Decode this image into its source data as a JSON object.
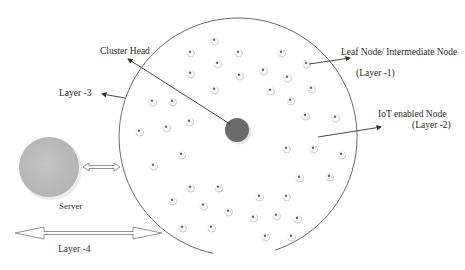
{
  "labels": {
    "cluster_head": "Cluster Head",
    "leaf_node": "Leaf Node/ Intermediate Node",
    "layer1": "(Layer -1)",
    "iot_node": "IoT enabled Node",
    "layer2": "(Layer -2)",
    "layer3": "Layer -3",
    "server": "Server",
    "layer4": "Layer -4"
  },
  "colors": {
    "outline": "#6a6a6a",
    "cluster_head": "#6b6b6b",
    "server": "#bdbdbd",
    "node_dot": "#6a6a6a",
    "node_shadow": "#d4d4d4",
    "arrow": "#333333",
    "text": "#2a2a2a"
  },
  "cluster": {
    "cx": 238,
    "cy": 137,
    "r": 119,
    "gap_start_deg": 72,
    "gap_end_deg": 102
  },
  "cluster_head": {
    "cx": 237,
    "cy": 130,
    "r": 12
  },
  "server": {
    "cx": 49,
    "cy": 167,
    "r": 31
  },
  "nodes": [
    [
      214,
      40
    ],
    [
      190,
      52
    ],
    [
      217,
      63
    ],
    [
      190,
      73
    ],
    [
      214,
      89
    ],
    [
      238,
      52
    ],
    [
      281,
      52
    ],
    [
      306,
      63
    ],
    [
      239,
      75
    ],
    [
      263,
      70
    ],
    [
      287,
      77
    ],
    [
      270,
      90
    ],
    [
      311,
      88
    ],
    [
      290,
      100
    ],
    [
      152,
      101
    ],
    [
      172,
      101
    ],
    [
      139,
      131
    ],
    [
      166,
      127
    ],
    [
      189,
      121
    ],
    [
      305,
      115
    ],
    [
      335,
      117
    ],
    [
      181,
      154
    ],
    [
      153,
      165
    ],
    [
      190,
      187
    ],
    [
      218,
      187
    ],
    [
      172,
      200
    ],
    [
      203,
      205
    ],
    [
      228,
      211
    ],
    [
      182,
      227
    ],
    [
      211,
      227
    ],
    [
      286,
      148
    ],
    [
      313,
      148
    ],
    [
      341,
      154
    ],
    [
      299,
      177
    ],
    [
      329,
      176
    ],
    [
      259,
      196
    ],
    [
      286,
      196
    ],
    [
      253,
      217
    ],
    [
      276,
      215
    ],
    [
      297,
      218
    ],
    [
      265,
      236
    ],
    [
      291,
      236
    ]
  ]
}
